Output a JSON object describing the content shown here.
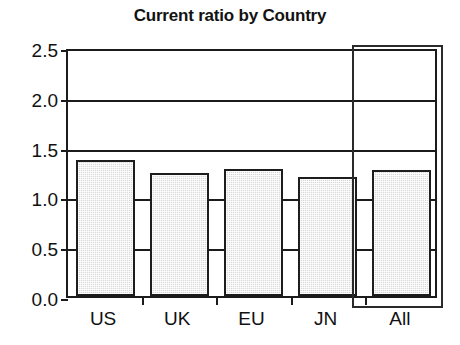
{
  "chart_data": {
    "type": "bar",
    "title": "Current ratio by Country",
    "xlabel": "",
    "ylabel": "",
    "categories": [
      "US",
      "UK",
      "EU",
      "JN",
      "All"
    ],
    "values": [
      1.37,
      1.24,
      1.28,
      1.19,
      1.27
    ],
    "ylim": [
      0.0,
      2.5
    ],
    "yticks": [
      "0.0",
      "0.5",
      "1.0",
      "1.5",
      "2.0",
      "2.5"
    ],
    "ytick_values": [
      0.0,
      0.5,
      1.0,
      1.5,
      2.0,
      2.5
    ],
    "grid": true,
    "legend": "none",
    "annotations": [
      {
        "name": "highlight-box",
        "target": "All",
        "description": "rectangle outline around the All column"
      }
    ],
    "colors": {
      "bar_fill": "#d8d8d8",
      "bar_edge": "#1d1d1d",
      "axis": "#1b1b1b",
      "text": "#111111",
      "background": "#ffffff"
    }
  }
}
